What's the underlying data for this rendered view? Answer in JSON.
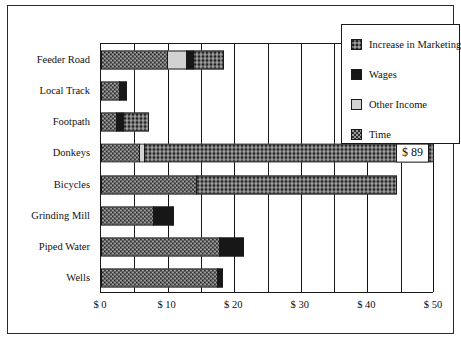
{
  "chart_data": {
    "type": "bar",
    "orientation": "horizontal",
    "stacked": true,
    "title": "",
    "xlabel": "",
    "ylabel": "",
    "xlim": [
      0,
      50
    ],
    "xticks": [
      0,
      10,
      20,
      30,
      40,
      50
    ],
    "xtick_labels": [
      "$ 0",
      "$ 10",
      "$ 20",
      "$ 30",
      "$ 40",
      "$ 50"
    ],
    "minor_tick_interval": 5,
    "grid": true,
    "legend_position": "top-right-inside",
    "categories": [
      "Feeder Road",
      "Local Track",
      "Footpath",
      "Donkeys",
      "Bicycles",
      "Grinding Mill",
      "Piped Water",
      "Wells"
    ],
    "series": [
      {
        "name": "Time",
        "pattern": "checkerboard",
        "color": "#9c9c9c",
        "values": [
          10.0,
          2.8,
          2.4,
          10.3,
          14.4,
          8.0,
          17.9,
          17.5
        ]
      },
      {
        "name": "Other Income",
        "pattern": "solid-light",
        "color": "#d2d2d2",
        "values": [
          2.9,
          0.0,
          0.0,
          1.2,
          0.0,
          0.0,
          0.0,
          0.0
        ]
      },
      {
        "name": "Wages",
        "pattern": "solid-black",
        "color": "#171717",
        "values": [
          1.0,
          1.1,
          1.0,
          0.0,
          0.0,
          3.0,
          3.6,
          0.8
        ]
      },
      {
        "name": "Increase in Marketing",
        "pattern": "dotted-dark",
        "color": "#6e6e6e",
        "values": [
          4.6,
          0.0,
          3.8,
          77.5,
          30.1,
          0.0,
          0.0,
          0.0
        ]
      }
    ],
    "totals": [
      18.5,
      3.9,
      7.2,
      89.0,
      44.5,
      11.0,
      21.5,
      18.3
    ],
    "annotations": [
      {
        "category": "Donkeys",
        "text": "$ 89"
      }
    ]
  },
  "legend": {
    "items": [
      {
        "label": "Increase in Marketing",
        "series": "Increase in Marketing"
      },
      {
        "label": "Wages",
        "series": "Wages"
      },
      {
        "label": "Other Income",
        "series": "Other Income"
      },
      {
        "label": "Time",
        "series": "Time"
      }
    ]
  }
}
